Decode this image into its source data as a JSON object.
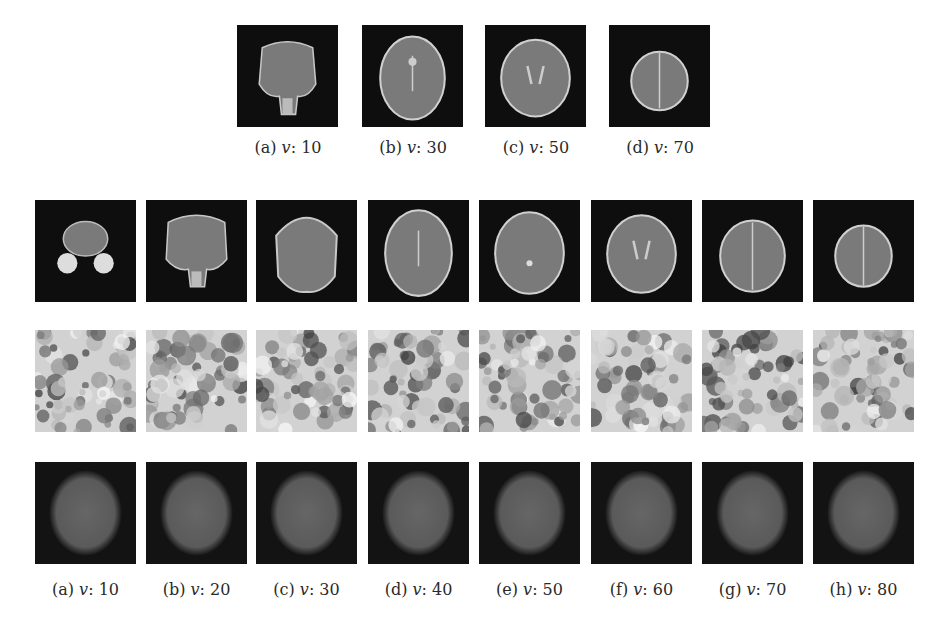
{
  "top_row": {
    "panels": [
      {
        "label": "(a)",
        "var": "v",
        "value": "10",
        "slice": "lower"
      },
      {
        "label": "(b)",
        "var": "v",
        "value": "30",
        "slice": "mid-low"
      },
      {
        "label": "(c)",
        "var": "v",
        "value": "50",
        "slice": "mid"
      },
      {
        "label": "(d)",
        "var": "v",
        "value": "70",
        "slice": "upper"
      }
    ]
  },
  "bottom_grid": {
    "rows": [
      {
        "name": "real-mri-slices",
        "type": "brain"
      },
      {
        "name": "generated-noise",
        "type": "noise"
      },
      {
        "name": "generated-blob",
        "type": "blob"
      }
    ],
    "columns": [
      {
        "label": "(a)",
        "var": "v",
        "value": "10"
      },
      {
        "label": "(b)",
        "var": "v",
        "value": "20"
      },
      {
        "label": "(c)",
        "var": "v",
        "value": "30"
      },
      {
        "label": "(d)",
        "var": "v",
        "value": "40"
      },
      {
        "label": "(e)",
        "var": "v",
        "value": "50"
      },
      {
        "label": "(f)",
        "var": "v",
        "value": "60"
      },
      {
        "label": "(g)",
        "var": "v",
        "value": "70"
      },
      {
        "label": "(h)",
        "var": "v",
        "value": "80"
      }
    ]
  }
}
